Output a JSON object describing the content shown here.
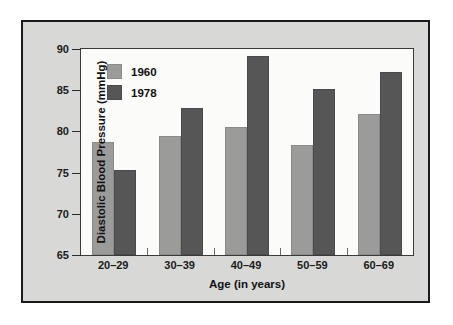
{
  "chart_data": {
    "type": "bar",
    "title": "",
    "xlabel": "Age (in years)",
    "ylabel": "Diastolic Blood Pressure (mmHg)",
    "categories": [
      "20–29",
      "30–39",
      "40–49",
      "50–59",
      "60–69"
    ],
    "series": [
      {
        "name": "1960",
        "color": "#9b9b99",
        "values": [
          78.7,
          79.4,
          80.5,
          78.3,
          82.1
        ]
      },
      {
        "name": "1978",
        "color": "#565656",
        "values": [
          75.3,
          82.9,
          89.1,
          85.2,
          87.2
        ]
      }
    ],
    "ylim": [
      65,
      90
    ],
    "yticks": [
      65,
      70,
      75,
      80,
      85,
      90
    ],
    "ytick_labels": [
      "65",
      "70",
      "75",
      "80",
      "85",
      "90"
    ],
    "grid": false,
    "legend_position": "top-left",
    "units": "mmHg"
  },
  "legend": {
    "entries": [
      {
        "label": "1960"
      },
      {
        "label": "1978"
      }
    ]
  },
  "colors": {
    "series_1960": "#9b9b99",
    "series_1978": "#565656",
    "panel_background": "#d8d8d6",
    "plot_background": "#fbfbfa",
    "frame": "#1a1a1a",
    "page": "#ffffff"
  }
}
